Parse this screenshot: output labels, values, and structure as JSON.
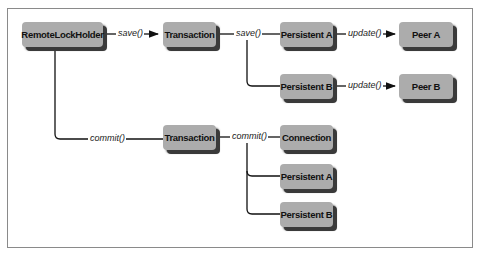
{
  "diagram": {
    "nodes": {
      "remote_lock_holder": "RemoteLockHolder",
      "transaction_top": "Transaction",
      "persistent_a_top": "Persistent A",
      "persistent_b_top": "Persistent B",
      "peer_a": "Peer A",
      "peer_b": "Peer B",
      "transaction_bottom": "Transaction",
      "connection": "Connection",
      "persistent_a_bottom": "Persistent A",
      "persistent_b_bottom": "Persistent B"
    },
    "edges": {
      "rlh_to_tx_save": "save()",
      "tx_save_branch": "save()",
      "pa_update": "update()",
      "pb_update": "update()",
      "rlh_commit": "commit()",
      "tx_commit_branch": "commit()"
    },
    "colors": {
      "box_fill": "#acacac",
      "box_shadow": "#3a3a3a",
      "line": "#111111",
      "frame": "#8a8a8a"
    }
  }
}
